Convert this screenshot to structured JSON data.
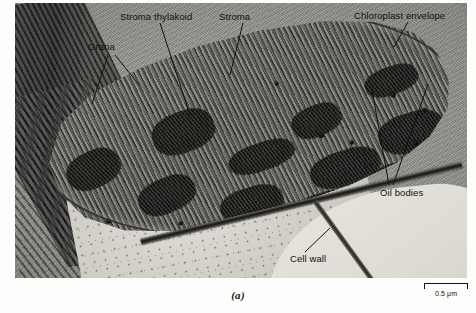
{
  "figure": {
    "panel_label": "(a)",
    "modality": "TEM grayscale micrograph"
  },
  "scale_bar": {
    "length_label": "0.5 μm",
    "value": 0.5,
    "unit": "μm"
  },
  "labels": [
    {
      "id": "grana",
      "text": "Grana",
      "leaders": 2
    },
    {
      "id": "stroma-thylakoid",
      "text": "Stroma thylakoid",
      "leaders": 1
    },
    {
      "id": "stroma",
      "text": "Stroma",
      "leaders": 1
    },
    {
      "id": "chloroplast-envelope",
      "text": "Chloroplast envelope",
      "leaders": 1
    },
    {
      "id": "oil-bodies",
      "text": "Oil bodies",
      "leaders": 2
    },
    {
      "id": "cell-wall",
      "text": "Cell wall",
      "leaders": 1
    }
  ],
  "colors": {
    "background": "#ffffff",
    "plate_mid_gray": "#8d8d8a",
    "grana_dark": "#1d1d1b",
    "oil_body_black": "#000000",
    "cytoplasm_light": "#dedcd6",
    "label_text": "#111111",
    "leader_line": "#111111"
  },
  "structures": {
    "grana_stacks": [
      {
        "x": 6,
        "y": 54,
        "w": 13,
        "h": 17,
        "rot": -18
      },
      {
        "x": 27,
        "y": 41,
        "w": 15,
        "h": 19,
        "rot": -14
      },
      {
        "x": 22,
        "y": 70,
        "w": 14,
        "h": 16,
        "rot": -16
      },
      {
        "x": 44,
        "y": 59,
        "w": 16,
        "h": 13,
        "rot": -12
      },
      {
        "x": 41,
        "y": 79,
        "w": 15,
        "h": 15,
        "rot": -10
      },
      {
        "x": 60,
        "y": 45,
        "w": 12,
        "h": 14,
        "rot": -15
      },
      {
        "x": 63,
        "y": 67,
        "w": 17,
        "h": 16,
        "rot": -11
      },
      {
        "x": 59,
        "y": 85,
        "w": 14,
        "h": 12,
        "rot": -9
      },
      {
        "x": 78,
        "y": 31,
        "w": 13,
        "h": 13,
        "rot": -13
      },
      {
        "x": 80,
        "y": 53,
        "w": 16,
        "h": 18,
        "rot": -10
      },
      {
        "x": 77,
        "y": 75,
        "w": 13,
        "h": 14,
        "rot": -8
      }
    ],
    "oil_bodies": [
      {
        "x": 14,
        "y": 86,
        "d": 5
      },
      {
        "x": 31,
        "y": 91,
        "d": 4
      },
      {
        "x": 57,
        "y": 32,
        "d": 4
      },
      {
        "x": 66,
        "y": 58,
        "d": 5
      },
      {
        "x": 73,
        "y": 63,
        "d": 4
      },
      {
        "x": 84,
        "y": 43,
        "d": 5
      },
      {
        "x": 88,
        "y": 66,
        "d": 5
      },
      {
        "x": 91,
        "y": 52,
        "d": 4
      }
    ]
  }
}
